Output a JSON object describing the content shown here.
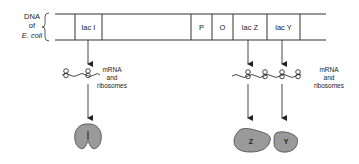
{
  "dna_label": {
    "line1": "DNA",
    "line2": "of",
    "line3": "E. coli"
  },
  "genes": [
    {
      "label": "lac I"
    },
    {
      "label": "P"
    },
    {
      "label": "O"
    },
    {
      "label": "lac Z"
    },
    {
      "label": "lac Y"
    }
  ],
  "mrna_left": {
    "line1": "mRNA",
    "line2": "and",
    "line3": "ribosomes"
  },
  "mrna_right": {
    "line1": "mRNA",
    "line2": "and",
    "line3": "ribosomes"
  },
  "proteins": [
    {
      "label": "I"
    },
    {
      "label": "Z"
    },
    {
      "label": "Y"
    }
  ],
  "colors": {
    "line": "#333333",
    "protein_fill": "#9a9a9a",
    "protein_stroke": "#444444"
  }
}
